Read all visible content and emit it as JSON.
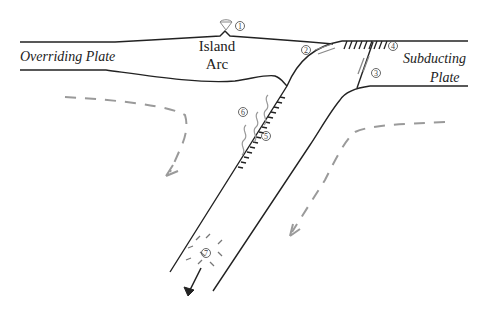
{
  "diagram": {
    "type": "subduction-zone-cross-section",
    "labels": {
      "overriding_plate": "Overriding Plate",
      "island_arc_line1": "Island",
      "island_arc_line2": "Arc",
      "subducting_plate_line1": "Subducting",
      "subducting_plate_line2": "Plate"
    },
    "markers": [
      {
        "id": "1",
        "text": "1",
        "location": "volcano on island arc"
      },
      {
        "id": "2",
        "text": "2",
        "location": "plate interface near trench"
      },
      {
        "id": "3",
        "text": "3",
        "location": "normal fault in subducting plate"
      },
      {
        "id": "4",
        "text": "4",
        "location": "outer-rise faulting at surface"
      },
      {
        "id": "5",
        "text": "5",
        "location": "slab top interface"
      },
      {
        "id": "6",
        "text": "6",
        "location": "fluids rising from slab"
      },
      {
        "id": "7",
        "text": "7",
        "location": "intermediate-depth slab"
      }
    ],
    "colors": {
      "lines": "#222222",
      "flow_arrows": "#9a9a9a",
      "background": "#ffffff"
    }
  }
}
